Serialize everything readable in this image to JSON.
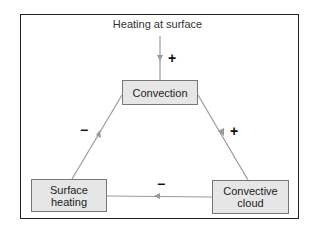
{
  "diagram": {
    "input_label": "Heating at surface",
    "nodes": [
      {
        "id": "convection",
        "label": "Convection"
      },
      {
        "id": "convective_cloud",
        "label": "Convective cloud"
      },
      {
        "id": "surface_heating",
        "label": "Surface heating"
      }
    ],
    "edges": [
      {
        "from": "heating_at_surface",
        "to": "convection",
        "sign": "+"
      },
      {
        "from": "convection",
        "to": "convective_cloud",
        "sign": "+"
      },
      {
        "from": "convective_cloud",
        "to": "surface_heating",
        "sign": "−"
      },
      {
        "from": "surface_heating",
        "to": "convection",
        "sign": "−"
      }
    ],
    "colors": {
      "arrow": "#999999",
      "box_fill": "#e6e6e6",
      "box_border": "#777777"
    }
  }
}
